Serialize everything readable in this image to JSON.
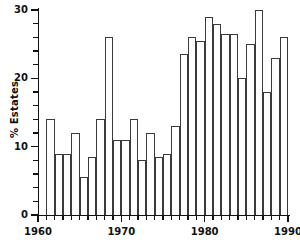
{
  "chart_data": {
    "type": "bar",
    "title": "",
    "xlabel": "",
    "ylabel": "% Estates",
    "categories": [
      1961,
      1962,
      1963,
      1964,
      1965,
      1966,
      1967,
      1968,
      1969,
      1970,
      1971,
      1972,
      1973,
      1974,
      1975,
      1976,
      1977,
      1978,
      1979,
      1980,
      1981,
      1982,
      1983,
      1984,
      1985,
      1986,
      1987,
      1988,
      1989
    ],
    "values": [
      14,
      9,
      9,
      12,
      5.5,
      8.5,
      14,
      26,
      11,
      11,
      14,
      8,
      12,
      8.5,
      9,
      13,
      23.5,
      26,
      25.5,
      29,
      28,
      26.5,
      26.5,
      20,
      25,
      30,
      18,
      23,
      26
    ],
    "xlim": [
      1960,
      1990
    ],
    "ylim": [
      0,
      30
    ],
    "ytick_labels": [
      "0",
      "10",
      "20",
      "30"
    ],
    "ytick_values": [
      0,
      10,
      20,
      30
    ],
    "yminor_step": 2,
    "xtick_labels": [
      "1960",
      "1970",
      "1980",
      "1990"
    ],
    "xtick_values": [
      1960,
      1970,
      1980,
      1990
    ],
    "xminor_step": 1,
    "grid": false,
    "legend": null,
    "bar_color": "#ffffff",
    "bar_edge_color": "#3a3a3a",
    "axis_color": "#111111"
  }
}
